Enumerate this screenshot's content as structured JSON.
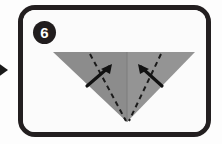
{
  "panel": {
    "step_number": "6",
    "frame_color": "#231f20",
    "background_color": "#fbfbfb"
  },
  "flow": {
    "arrow_label": "previous-step-arrow",
    "arrow_color": "#1a1a1a",
    "direction": "right"
  },
  "figure": {
    "name": "inverted-triangle-origami",
    "description": "Downward pointing triangle of folded paper, split into two shaded halves by a vertical center crease",
    "fill_left": "#8c8c8c",
    "fill_right": "#949494",
    "center_crease_color": "#7d7d7d",
    "fold_line_color": "#1b1b1b",
    "fold_line_style": "dashed",
    "arrow_color": "#121212",
    "fold_arrows": [
      {
        "name": "left-fold-arrow",
        "points": "up-right",
        "label": ""
      },
      {
        "name": "right-fold-arrow",
        "points": "up-left",
        "label": ""
      }
    ],
    "vertices": {
      "top_left": "48,47",
      "top_right": "190,47",
      "apex": "122,117"
    }
  }
}
